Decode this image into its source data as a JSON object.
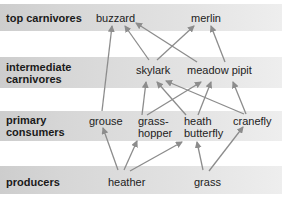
{
  "levels": [
    {
      "id": "top",
      "label": "top carnivores"
    },
    {
      "id": "intermediate",
      "label_line1": "intermediate",
      "label_line2": "carnivores"
    },
    {
      "id": "primary",
      "label_line1": "primary",
      "label_line2": "consumers"
    },
    {
      "id": "producers",
      "label": "producers"
    }
  ],
  "nodes": {
    "buzzard": "buzzard",
    "merlin": "merlin",
    "skylark": "skylark",
    "meadow_pipit": "meadow pipit",
    "grouse": "grouse",
    "grasshopper_line1": "grass-",
    "grasshopper_line2": "hopper",
    "heath_butterfly_line1": "heath",
    "heath_butterfly_line2": "butterfly",
    "cranefly": "cranefly",
    "heather": "heather",
    "grass": "grass"
  },
  "edges": [
    {
      "from": "grouse",
      "to": "buzzard"
    },
    {
      "from": "skylark",
      "to": "buzzard"
    },
    {
      "from": "meadow pipit",
      "to": "buzzard"
    },
    {
      "from": "skylark",
      "to": "merlin"
    },
    {
      "from": "meadow pipit",
      "to": "merlin"
    },
    {
      "from": "grasshopper",
      "to": "skylark"
    },
    {
      "from": "heath butterfly",
      "to": "skylark"
    },
    {
      "from": "cranefly",
      "to": "skylark"
    },
    {
      "from": "grasshopper",
      "to": "meadow pipit"
    },
    {
      "from": "heath butterfly",
      "to": "meadow pipit"
    },
    {
      "from": "cranefly",
      "to": "meadow pipit"
    },
    {
      "from": "heather",
      "to": "grouse"
    },
    {
      "from": "heather",
      "to": "grasshopper"
    },
    {
      "from": "heather",
      "to": "heath butterfly"
    },
    {
      "from": "grass",
      "to": "heath butterfly"
    },
    {
      "from": "grass",
      "to": "cranefly"
    }
  ],
  "colors": {
    "arrow": "#8c8c8c",
    "band_dark": "#cdcdcd",
    "band_light": "#eeeeee"
  }
}
